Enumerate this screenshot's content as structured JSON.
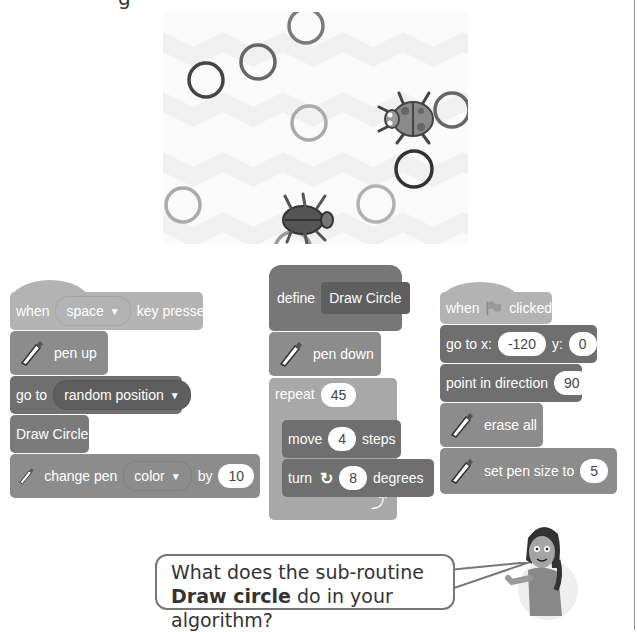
{
  "top_fragment": "g",
  "stage": {
    "circles": [
      {
        "cx": 143,
        "cy": 14,
        "r": 17,
        "shade": "#7a7a7a"
      },
      {
        "cx": 95,
        "cy": 50,
        "r": 17,
        "shade": "#666666"
      },
      {
        "cx": 43,
        "cy": 68,
        "r": 17,
        "shade": "#444444"
      },
      {
        "cx": 146,
        "cy": 111,
        "r": 17,
        "shade": "#aaaaaa"
      },
      {
        "cx": 289,
        "cy": 98,
        "r": 17,
        "shade": "#666666"
      },
      {
        "cx": 251,
        "cy": 157,
        "r": 18,
        "shade": "#333333"
      },
      {
        "cx": 20,
        "cy": 193,
        "r": 17,
        "shade": "#aaaaaa"
      },
      {
        "cx": 213,
        "cy": 192,
        "r": 18,
        "shade": "#b0b0b0"
      },
      {
        "cx": 130,
        "cy": 238,
        "r": 18,
        "shade": "#999999"
      }
    ],
    "sprites": [
      {
        "name": "ladybug",
        "x": 238,
        "y": 98
      },
      {
        "name": "beetle",
        "x": 130,
        "y": 195
      }
    ]
  },
  "scripts": {
    "space_script": {
      "hat": {
        "when": "when",
        "key": "space",
        "suffix": "key pressed"
      },
      "pen_up": "pen up",
      "go_to": {
        "label": "go to",
        "target": "random position"
      },
      "draw_circle": "Draw Circle",
      "change_pen": {
        "label": "change pen",
        "param": "color",
        "by": "by",
        "value": "10"
      }
    },
    "define_script": {
      "define": {
        "label": "define",
        "name": "Draw Circle"
      },
      "pen_down": "pen down",
      "repeat": {
        "label": "repeat",
        "value": "45"
      },
      "move": {
        "label": "move",
        "value": "4",
        "suffix": "steps"
      },
      "turn": {
        "label": "turn",
        "value": "8",
        "suffix": "degrees"
      }
    },
    "flag_script": {
      "hat": {
        "when": "when",
        "suffix": "clicked"
      },
      "go_to_xy": {
        "label": "go to x:",
        "x": "-120",
        "y_label": "y:",
        "y": "0"
      },
      "point": {
        "label": "point in direction",
        "value": "90"
      },
      "erase_all": "erase all",
      "set_pen_size": {
        "label": "set pen size to",
        "value": "5"
      }
    }
  },
  "bubble": {
    "text_before": "What does the sub-routine ",
    "bold": "Draw circle",
    "text_after": " do in your algorithm?"
  }
}
